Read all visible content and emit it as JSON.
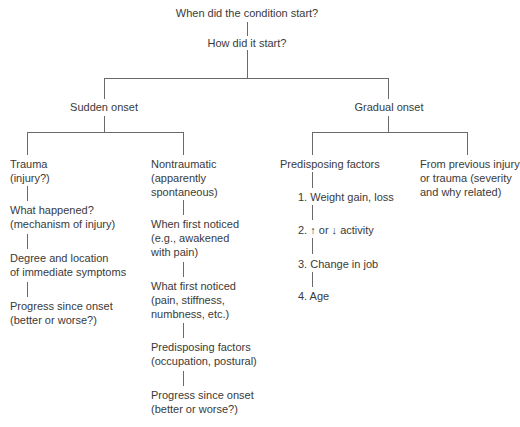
{
  "diagram": {
    "root": "When did the condition start?",
    "question2": "How did it start?",
    "branches": {
      "sudden": {
        "label": "Sudden onset",
        "trauma": {
          "label_line1": "Trauma",
          "label_line2": "(injury?)",
          "steps": [
            {
              "line1": "What happened?",
              "line2": "(mechanism of injury)"
            },
            {
              "line1": "Degree and location",
              "line2": "of immediate symptoms"
            },
            {
              "line1": "Progress since onset",
              "line2": "(better or worse?)"
            }
          ]
        },
        "nontraumatic": {
          "label_line1": "Nontraumatic",
          "label_line2": "(apparently",
          "label_line3": "spontaneous)",
          "steps": [
            {
              "line1": "When first noticed",
              "line2": "(e.g., awakened",
              "line3": "with pain)"
            },
            {
              "line1": "What first noticed",
              "line2": "(pain, stiffness,",
              "line3": "numbness, etc.)"
            },
            {
              "line1": "Predisposing factors",
              "line2": "(occupation, postural)"
            },
            {
              "line1": "Progress since onset",
              "line2": "(better or worse?)"
            }
          ]
        }
      },
      "gradual": {
        "label": "Gradual onset",
        "predisposing": {
          "label": "Predisposing factors",
          "items": [
            "1. Weight gain, loss",
            "2. ↑ or ↓ activity",
            "3. Change in job",
            "4. Age"
          ]
        },
        "previous": {
          "line1": "From previous injury",
          "line2": "or trauma (severity",
          "line3": "and why related)"
        }
      }
    }
  }
}
